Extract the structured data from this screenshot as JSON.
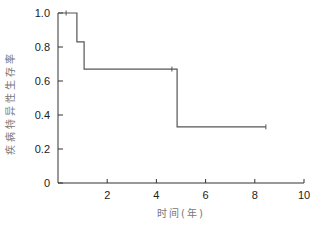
{
  "chart_data": {
    "type": "line",
    "subtype": "kaplan-meier-step",
    "title": "",
    "xlabel": "时间(年)",
    "ylabel": "疾病特异性生存率",
    "xlim": [
      0,
      10
    ],
    "ylim": [
      0,
      1.0
    ],
    "x_ticks": [
      2,
      4,
      6,
      8,
      10
    ],
    "x_tick_labels": [
      "2",
      "4",
      "6",
      "8",
      "10"
    ],
    "y_ticks": [
      0,
      0.2,
      0.4,
      0.6,
      0.8,
      1.0
    ],
    "y_tick_labels": [
      "0",
      "0.2",
      "0.4",
      "0.6",
      "0.8",
      "1.0"
    ],
    "grid": false,
    "legend": null,
    "series": [
      {
        "name": "疾病特异性生存率",
        "color": "#555555",
        "steps": [
          {
            "x": 0,
            "y": 1.0
          },
          {
            "x": 0.77,
            "y": 1.0
          },
          {
            "x": 0.77,
            "y": 0.83
          },
          {
            "x": 1.06,
            "y": 0.83
          },
          {
            "x": 1.06,
            "y": 0.67
          },
          {
            "x": 4.84,
            "y": 0.67
          },
          {
            "x": 4.84,
            "y": 0.33
          },
          {
            "x": 8.45,
            "y": 0.33
          }
        ],
        "censored": [
          {
            "x": 0.33,
            "y": 1.0
          },
          {
            "x": 4.63,
            "y": 0.67
          },
          {
            "x": 8.45,
            "y": 0.33
          }
        ]
      }
    ]
  },
  "layout": {
    "plot": {
      "x0": 58,
      "x1": 304,
      "y0": 183,
      "y1": 13
    },
    "axis_color": "#333333",
    "line_color": "#555555"
  }
}
